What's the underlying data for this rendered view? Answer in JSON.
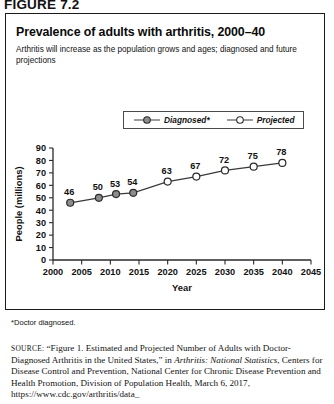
{
  "figure_label": "FIGURE 7.2",
  "panel": {
    "title": "Prevalence of adults with arthritis, 2000–40",
    "subtitle": "Arthritis will increase as the population grows and ages; diagnosed and future projections"
  },
  "legend": {
    "items": [
      {
        "label": "Diagnosed*",
        "marker": "filled-circle-icon",
        "color": "#8c8c8c"
      },
      {
        "label": "Projected",
        "marker": "open-circle-icon",
        "color": "#ffffff"
      }
    ]
  },
  "notes": {
    "footnote": "*Doctor diagnosed.",
    "source_prefix": "SOURCE:",
    "source_part1": " “Figure 1. Estimated and Projected Number of Adults with Doctor-Diagnosed Arthritis in the United States,” in ",
    "source_italic1": "Arthritis: National Statistics",
    "source_part2": ", Centers for Disease Control and Prevention, National Center for Chronic Disease Prevention and Health Promotion, Division of Population Health, March 6, 2017, https://www.cdc.gov/arthritis/data_"
  },
  "chart_data": {
    "type": "line",
    "title": "Prevalence of adults with arthritis, 2000–40",
    "xlabel": "Year",
    "ylabel": "People (millions)",
    "xlim": [
      2000,
      2045
    ],
    "ylim": [
      0,
      90
    ],
    "xticks": [
      2000,
      2005,
      2010,
      2015,
      2020,
      2025,
      2030,
      2035,
      2040,
      2045
    ],
    "yticks": [
      0,
      10,
      20,
      30,
      40,
      50,
      60,
      70,
      80,
      90
    ],
    "grid": false,
    "legend_position": "top-center",
    "series": [
      {
        "name": "Diagnosed*",
        "marker": "filled-circle",
        "x": [
          2003,
          2008,
          2011,
          2014
        ],
        "values": [
          46,
          50,
          53,
          54
        ],
        "labels": [
          "46",
          "50",
          "53",
          "54"
        ]
      },
      {
        "name": "Projected",
        "marker": "open-circle",
        "x": [
          2020,
          2025,
          2030,
          2035,
          2040
        ],
        "values": [
          63,
          67,
          72,
          75,
          78
        ],
        "labels": [
          "63",
          "67",
          "72",
          "75",
          "78"
        ]
      }
    ],
    "connector": {
      "from_x": 2014,
      "from_y": 54,
      "to_x": 2020,
      "to_y": 63
    }
  }
}
